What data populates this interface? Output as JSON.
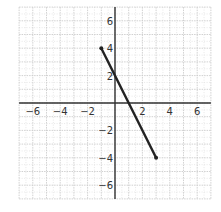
{
  "chart_data": {
    "type": "line",
    "title": "",
    "xlabel": "",
    "ylabel": "",
    "xlim": [
      -7,
      7
    ],
    "ylim": [
      -7,
      7
    ],
    "grid": true,
    "x_ticks": [
      -6,
      -4,
      -2,
      2,
      4,
      6
    ],
    "y_ticks": [
      -6,
      -4,
      -2,
      2,
      4,
      6
    ],
    "x_tick_labels": [
      "−6",
      "−4",
      "−2",
      "2",
      "4",
      "6"
    ],
    "y_tick_labels": [
      "−6",
      "−4",
      "−2",
      "2",
      "4",
      "6"
    ],
    "series": [
      {
        "name": "segment",
        "x": [
          -1,
          3
        ],
        "y": [
          4,
          -4
        ],
        "color": "#222222",
        "endpoints": "filled"
      }
    ]
  },
  "colors": {
    "axis": "#333333",
    "grid": "#cccccc",
    "line": "#222222"
  }
}
